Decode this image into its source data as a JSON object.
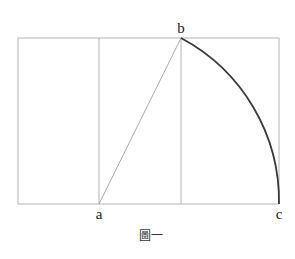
{
  "figure": {
    "caption": "圖一",
    "labels": {
      "a": "a",
      "b": "b",
      "c": "c"
    },
    "colors": {
      "frame": "#b0b0b0",
      "diagonal": "#a8a8a8",
      "arc": "#3a3a3a",
      "text": "#222222"
    },
    "geometry": {
      "outer_rect": {
        "left": 18,
        "top": 38,
        "right": 279,
        "bottom": 204
      },
      "vertical_lines_x": [
        99,
        181
      ],
      "point_a": [
        99,
        204
      ],
      "point_b": [
        181,
        38
      ],
      "point_c": [
        279,
        204
      ],
      "arc": {
        "center": "a",
        "from": "b",
        "to": "c",
        "radius": 185
      }
    }
  }
}
